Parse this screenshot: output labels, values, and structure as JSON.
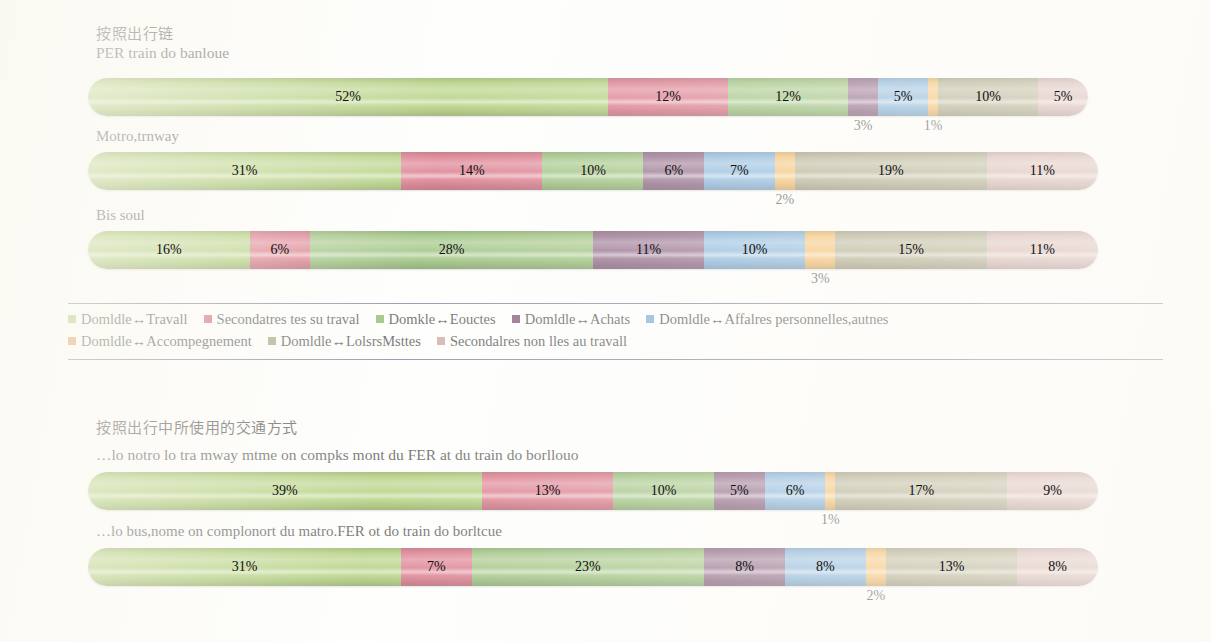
{
  "chart_data": {
    "type": "bar",
    "orientation": "horizontal",
    "stacked": true,
    "unit": "%",
    "xlim": [
      0,
      100
    ],
    "grid": false,
    "legend_position": "below-section-1",
    "title": "",
    "xlabel": "",
    "ylabel": "",
    "categories": [
      "Domldle ↔ Travall",
      "Secondatres tes su traval",
      "Domkle ↔ Eouctes",
      "Domldle ↔ Achats",
      "Domldle ↔ Affalres personnelles,autnes",
      "Domldle ↔ Accompegnement",
      "Domldle ↔ LolsrsMsttes",
      "Secondalres non lles au travall"
    ],
    "colors": [
      "#8cb83c",
      "#c8354f",
      "#6aa33c",
      "#5c2250",
      "#4f93cd",
      "#f0a02a",
      "#8a8456",
      "#c08f8a"
    ],
    "series": [
      {
        "name": "PER train do banloue",
        "values": [
          52,
          12,
          12,
          3,
          5,
          1,
          10,
          5
        ]
      },
      {
        "name": "Motro,trnway",
        "values": [
          31,
          14,
          10,
          6,
          7,
          2,
          19,
          11
        ]
      },
      {
        "name": "Bis soul",
        "values": [
          16,
          6,
          28,
          11,
          10,
          3,
          15,
          11
        ]
      },
      {
        "name": "...lo notro lo tra mway mtme on compks mont du FER at du train do borllouo",
        "values": [
          39,
          13,
          10,
          5,
          6,
          1,
          17,
          9
        ]
      },
      {
        "name": "...lo bus,nome on complonort du matro.FER ot do train do borltcue",
        "values": [
          31,
          7,
          23,
          8,
          8,
          2,
          13,
          8
        ]
      }
    ]
  },
  "sections": [
    {
      "title_cn": "按照出行链",
      "bars": [
        {
          "label": "PER train do banloue",
          "values": [
            52,
            12,
            12,
            3,
            5,
            1,
            10,
            5
          ],
          "inline_labels": [
            "52%",
            "12%",
            "12%",
            "",
            "5%",
            "",
            "10%",
            "5%"
          ],
          "callouts": [
            {
              "index": 3,
              "text": "3%"
            },
            {
              "index": 5,
              "text": "1%"
            }
          ]
        },
        {
          "label": "Motro,trnway",
          "values": [
            31,
            14,
            10,
            6,
            7,
            2,
            19,
            11
          ],
          "inline_labels": [
            "31%",
            "14%",
            "10%",
            "6%",
            "7%",
            "",
            "19%",
            "11%"
          ],
          "callouts": [
            {
              "index": 5,
              "text": "2%"
            }
          ]
        },
        {
          "label": "Bis soul",
          "values": [
            16,
            6,
            28,
            11,
            10,
            3,
            15,
            11
          ],
          "inline_labels": [
            "16%",
            "6%",
            "28%",
            "11%",
            "10%",
            "",
            "15%",
            "11%"
          ],
          "callouts": [
            {
              "index": 5,
              "text": "3%"
            }
          ]
        }
      ]
    },
    {
      "title_cn": "按照出行中所使用的交通方式",
      "bars": [
        {
          "label": "…lo notro lo tra mway mtme on compks mont du FER at du train do borllouo",
          "values": [
            39,
            13,
            10,
            5,
            6,
            1,
            17,
            9
          ],
          "inline_labels": [
            "39%",
            "13%",
            "10%",
            "5%",
            "6%",
            "",
            "17%",
            "9%"
          ],
          "callouts": [
            {
              "index": 5,
              "text": "1%"
            }
          ]
        },
        {
          "label": "…lo bus,nome on complonort du matro.FER ot do train do borltcue",
          "values": [
            31,
            7,
            23,
            8,
            8,
            2,
            13,
            8
          ],
          "inline_labels": [
            "31%",
            "7%",
            "23%",
            "8%",
            "8%",
            "",
            "13%",
            "8%"
          ],
          "callouts": [
            {
              "index": 5,
              "text": "2%"
            }
          ]
        }
      ]
    }
  ],
  "legend": {
    "rows": [
      [
        {
          "label": "Domldle↔Travall",
          "color": "#8cb83c"
        },
        {
          "label": "Secondatres tes su traval",
          "color": "#c8354f"
        },
        {
          "label": "Domkle↔Eouctes",
          "color": "#6aa33c"
        },
        {
          "label": "Domldle↔Achats",
          "color": "#5c2250"
        },
        {
          "label": "Domldle↔Affalres personnelles,autnes",
          "color": "#4f93cd"
        }
      ],
      [
        {
          "label": "Domldle↔Accompegnement",
          "color": "#d2791f"
        },
        {
          "label": "Domldle↔LolsrsMsttes",
          "color": "#8a8456"
        },
        {
          "label": "Secondalres non lles au travall",
          "color": "#c08f8a"
        }
      ]
    ]
  }
}
